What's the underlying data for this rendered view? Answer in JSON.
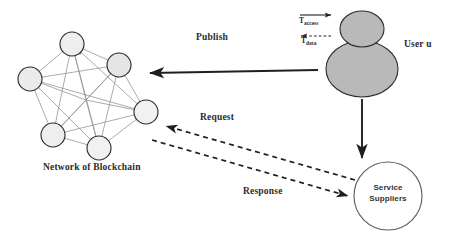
{
  "diagram": {
    "background_color": "#ffffff",
    "width": 451,
    "height": 242
  },
  "labels": {
    "publish": "Publish",
    "request": "Request",
    "response": "Response",
    "network_of_blockchain": "Network of Blockchain",
    "user": "User u",
    "service_suppliers_line1": "Service",
    "service_suppliers_line2": "Suppliers",
    "t_access_base": "T",
    "t_access_sub": "access",
    "t_data_base": "T",
    "t_data_sub": "data"
  },
  "nodes": {
    "blockchain_node_count": 7,
    "node_fill": "#eceaea",
    "node_stroke": "#2b2b2b",
    "positions": [
      {
        "name": "node-top",
        "cx": 72,
        "cy": 44,
        "r": 12
      },
      {
        "name": "node-upper-right",
        "cx": 119,
        "cy": 65,
        "r": 12
      },
      {
        "name": "node-left",
        "cx": 30,
        "cy": 79,
        "r": 12
      },
      {
        "name": "node-right",
        "cx": 146,
        "cy": 112,
        "r": 12
      },
      {
        "name": "node-lower-left",
        "cx": 53,
        "cy": 135,
        "r": 12
      },
      {
        "name": "node-bottom",
        "cx": 99,
        "cy": 148,
        "r": 12
      },
      {
        "name": "node-mid",
        "cx": 86,
        "cy": 100,
        "r": 0
      }
    ]
  },
  "user_figure": {
    "head_fill": "#b8b8b8",
    "body_fill": "#b8b8b8",
    "stroke": "#2b2b2b",
    "head": {
      "cx": 362,
      "cy": 29,
      "rx": 22,
      "ry": 18
    },
    "body": {
      "cx": 362,
      "cy": 69,
      "rx": 36,
      "ry": 28
    }
  },
  "supplier_circle": {
    "cx": 388,
    "cy": 196,
    "r": 34,
    "fill": "#ffffff",
    "stroke": "#555555"
  },
  "arrows": {
    "publish": {
      "from": "user",
      "to": "blockchain",
      "style": "solid",
      "direction": "left"
    },
    "user_to_supplier": {
      "from": "user",
      "to": "service-suppliers",
      "style": "solid",
      "direction": "down"
    },
    "request": {
      "from": "service-suppliers",
      "to": "blockchain",
      "style": "dashed",
      "direction": "left"
    },
    "response": {
      "from": "blockchain",
      "to": "service-suppliers",
      "style": "dashed",
      "direction": "right"
    },
    "t_access": {
      "style": "solid",
      "direction": "right"
    },
    "t_data": {
      "style": "dashed",
      "direction": "left"
    }
  },
  "colors": {
    "line": "#2b2b2b",
    "mesh_line": "#8a8a8a",
    "text": "#2b2b2b"
  }
}
